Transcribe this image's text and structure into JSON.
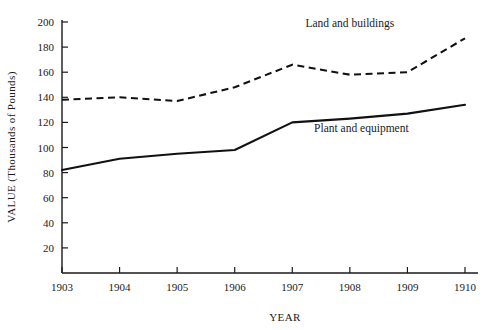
{
  "chart_data": {
    "type": "line",
    "title": "",
    "xlabel": "YEAR",
    "ylabel": "VALUE (Thousands of Pounds)",
    "categories": [
      "1903",
      "1904",
      "1905",
      "1906",
      "1907",
      "1908",
      "1909",
      "1910"
    ],
    "x": [
      1903,
      1904,
      1905,
      1906,
      1907,
      1908,
      1909,
      1910
    ],
    "xlim": [
      1903,
      1910
    ],
    "ylim": [
      0,
      200
    ],
    "yticks": [
      20,
      40,
      60,
      80,
      100,
      120,
      140,
      160,
      180,
      200
    ],
    "ytick_labels": [
      "20",
      "40",
      "60",
      "80",
      "100",
      "120",
      "140",
      "160",
      "180",
      "200"
    ],
    "grid": false,
    "legend_position": "inline-annotations",
    "series": [
      {
        "name": "Land and buildings",
        "style": "dashed",
        "color": "#111111",
        "values": [
          138,
          140,
          137,
          148,
          166,
          158,
          160,
          187
        ]
      },
      {
        "name": "Plant and equipment",
        "style": "solid",
        "color": "#111111",
        "values": [
          82,
          91,
          95,
          98,
          120,
          123,
          127,
          134
        ]
      }
    ],
    "annotations": [
      {
        "text": "Land and buildings",
        "x": 1908.0,
        "y": 196
      },
      {
        "text": "Plant and equipment",
        "x": 1908.2,
        "y": 112
      }
    ]
  }
}
